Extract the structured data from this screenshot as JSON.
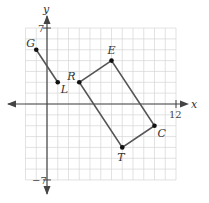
{
  "diagram": {
    "type": "coordinate-plane",
    "axes": {
      "x_label": "x",
      "y_label": "y",
      "x_range": [
        -2,
        12
      ],
      "y_range": [
        -7,
        7
      ],
      "tick_labels": {
        "x_max": "12",
        "y_max": "7",
        "y_min": "−7"
      }
    },
    "colors": {
      "grid": "#d6d6d6",
      "axis": "#444444",
      "shape": "#555555",
      "point": "#111111"
    },
    "segment_GL": {
      "points": [
        {
          "name": "G",
          "x": -1,
          "y": 5
        },
        {
          "name": "L",
          "x": 1,
          "y": 2
        }
      ]
    },
    "rectangle_RECT": {
      "points": [
        {
          "name": "R",
          "x": 3,
          "y": 2
        },
        {
          "name": "E",
          "x": 6,
          "y": 4
        },
        {
          "name": "C",
          "x": 10,
          "y": -2
        },
        {
          "name": "T",
          "x": 7,
          "y": -4
        }
      ]
    }
  }
}
